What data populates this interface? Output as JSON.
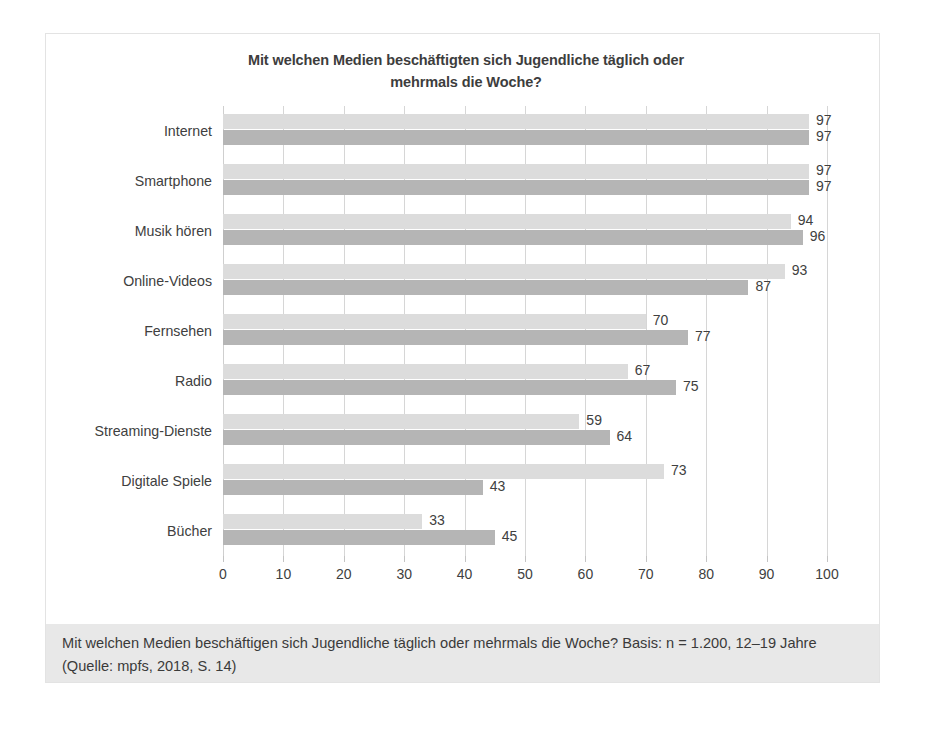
{
  "chart_data": {
    "type": "bar",
    "orientation": "horizontal",
    "title": "Mit welchen Medien beschäftigten sich Jugendliche täglich oder mehrmals die Woche?",
    "title_lines": [
      "Mit welchen Medien beschäftigten sich Jugendliche täglich oder",
      "mehrmals die Woche?"
    ],
    "xlabel": "",
    "ylabel": "",
    "xlim": [
      0,
      100
    ],
    "xticks": [
      0,
      10,
      20,
      30,
      40,
      50,
      60,
      70,
      80,
      90,
      100
    ],
    "xtick_labels": [
      "0",
      "10",
      "20",
      "30",
      "40",
      "50",
      "60",
      "70",
      "80",
      "90",
      "100"
    ],
    "grid": true,
    "grid_axis": "x",
    "legend_position": "bottom-center",
    "categories": [
      "Internet",
      "Smartphone",
      "Musik hören",
      "Online-Videos",
      "Fernsehen",
      "Radio",
      "Streaming-Dienste",
      "Digitale Spiele",
      "Bücher"
    ],
    "series": [
      {
        "name": "Jungen",
        "color": "#dcdcdc",
        "values": [
          97,
          97,
          94,
          93,
          70,
          67,
          59,
          73,
          33
        ]
      },
      {
        "name": "Mädchen",
        "color": "#b5b5b5",
        "values": [
          97,
          97,
          96,
          87,
          77,
          75,
          64,
          43,
          45
        ]
      }
    ]
  },
  "caption": {
    "text": "Mit welchen Medien beschäftigen sich Jugendliche täglich oder mehrmals die Woche? Basis: n = 1.200, 12–19 Jahre (Quelle: mpfs, 2018, S. 14)"
  },
  "colors": {
    "series_jungen": "#dcdcdc",
    "series_maedchen": "#b5b5b5",
    "gridline": "#d6d6d6",
    "text": "#404040",
    "caption_background": "#e8e8e8",
    "figure_border": "#e3e3e3"
  }
}
